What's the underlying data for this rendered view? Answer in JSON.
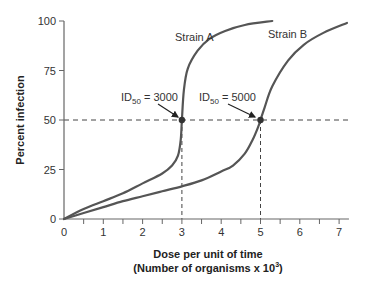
{
  "chart_data": {
    "type": "line",
    "title": "",
    "xlabel": "Dose per unit of time",
    "xlabel_line2": "(Number of organisms x 10",
    "xlabel_sup": "3",
    "xlabel_close": ")",
    "ylabel": "Percent infection",
    "xlim": [
      0,
      7.2
    ],
    "ylim": [
      0,
      100
    ],
    "x_ticks": [
      0,
      1,
      2,
      3,
      4,
      5,
      6,
      7
    ],
    "x_tick_labels": [
      "0",
      "1",
      "2",
      "3",
      "4",
      "5",
      "6",
      "7"
    ],
    "y_ticks": [
      0,
      25,
      50,
      75,
      100
    ],
    "y_tick_labels": [
      "0",
      "25",
      "50",
      "75",
      "100"
    ],
    "grid": false,
    "legend": "inline labels on curves",
    "series": [
      {
        "name": "Strain A",
        "x": [
          0,
          0.5,
          1.0,
          1.5,
          2.0,
          2.5,
          2.75,
          2.9,
          2.97,
          3.0,
          3.05,
          3.15,
          3.4,
          3.7,
          4.1,
          4.6,
          5.3
        ],
        "y": [
          0,
          5,
          9,
          13,
          18,
          23,
          27,
          32,
          40,
          50,
          65,
          76,
          85,
          91,
          95,
          98,
          100
        ]
      },
      {
        "name": "Strain B",
        "x": [
          0,
          0.5,
          1.0,
          1.5,
          2.0,
          2.5,
          3.0,
          3.5,
          4.0,
          4.3,
          4.6,
          4.8,
          4.95,
          5.0,
          5.1,
          5.3,
          5.7,
          6.1,
          6.6,
          7.2
        ],
        "y": [
          0,
          3,
          6,
          9,
          11.5,
          14,
          16.5,
          19.5,
          24,
          27,
          33,
          40,
          47,
          50,
          56,
          67,
          80,
          88,
          94,
          99
        ]
      }
    ],
    "annotations": [
      {
        "label_main": "ID",
        "label_sub": "50",
        "label_value": " = 3000",
        "point": [
          3,
          50
        ],
        "series": "Strain A"
      },
      {
        "label_main": "ID",
        "label_sub": "50",
        "label_value": " = 5000",
        "point": [
          5,
          50
        ],
        "series": "Strain B"
      }
    ],
    "reference_lines": [
      {
        "type": "horizontal",
        "y": 50,
        "style": "dashed"
      },
      {
        "type": "vertical",
        "x": 3,
        "style": "dashed"
      },
      {
        "type": "vertical",
        "x": 5,
        "style": "dashed"
      }
    ],
    "colors": {
      "curve": "#555555",
      "axis": "#666666",
      "dashed": "#444444",
      "marker": "#333333"
    }
  }
}
